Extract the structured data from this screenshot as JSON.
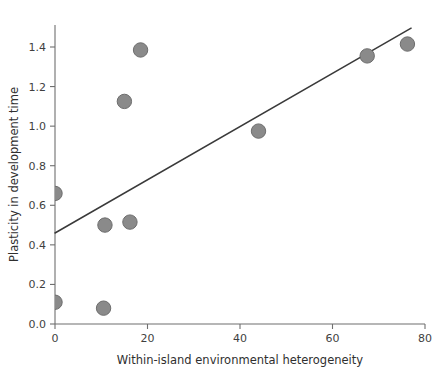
{
  "chart_data": {
    "type": "scatter",
    "title": "",
    "xlabel": "Within-island environmental heterogeneity",
    "ylabel": "Plasticity in development time",
    "xlim": [
      0,
      80
    ],
    "ylim": [
      0.0,
      1.5
    ],
    "grid": false,
    "legend": "none",
    "xticks": [
      0,
      20,
      40,
      60,
      80
    ],
    "xtick_labels": [
      "0",
      "20",
      "40",
      "60",
      "80"
    ],
    "yticks": [
      0.0,
      0.2,
      0.4,
      0.6,
      0.8,
      1.0,
      1.2,
      1.4
    ],
    "ytick_labels": [
      "0.0",
      "0.2",
      "0.4",
      "0.6",
      "0.8",
      "1.0",
      "1.2",
      "1.4"
    ],
    "marker_color": "#8a8a8a",
    "marker_edge_color": "#6d6d6d",
    "line_color": "#3a3a3a",
    "axis_color": "#6f6f6f",
    "points": [
      {
        "x": 0.0,
        "y": 0.66
      },
      {
        "x": 0.0,
        "y": 0.11
      },
      {
        "x": 10.5,
        "y": 0.08
      },
      {
        "x": 10.8,
        "y": 0.5
      },
      {
        "x": 15.0,
        "y": 1.125
      },
      {
        "x": 16.2,
        "y": 0.515
      },
      {
        "x": 18.5,
        "y": 1.385
      },
      {
        "x": 44.0,
        "y": 0.975
      },
      {
        "x": 67.5,
        "y": 1.355
      },
      {
        "x": 76.2,
        "y": 1.415
      }
    ],
    "trend_line": {
      "x0": 0.0,
      "y0": 0.46,
      "x1": 77.0,
      "y1": 1.495
    }
  }
}
